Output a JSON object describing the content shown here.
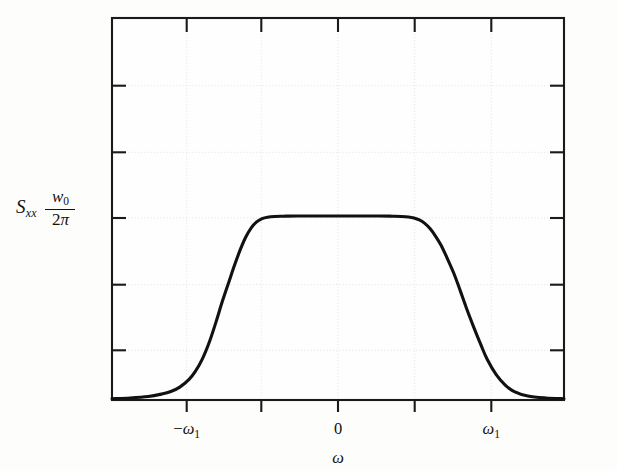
{
  "figure": {
    "background_color": "#fdfdfc",
    "curve_color": "#111111",
    "grid_color": "#e2e2e2",
    "axis_color": "#1a1a1a",
    "y_axis_label_symbol": "S",
    "y_axis_label_subscript": "xx",
    "y_axis_value_numerator": "w",
    "y_axis_value_numerator_sub": "0",
    "y_axis_value_denominator_num": "2",
    "y_axis_value_denominator_sym": "π",
    "x_axis_title": "ω",
    "x_tick_labels": [
      "−ω",
      "0",
      "ω"
    ],
    "x_tick_label_left": "−ω",
    "x_tick_label_left_sub": "1",
    "x_tick_label_center": "0",
    "x_tick_label_right": "ω",
    "x_tick_label_right_sub": "1"
  },
  "chart_data": {
    "type": "line",
    "title": "",
    "subtitle": "",
    "xlabel": "ω",
    "ylabel": "S_xx",
    "legend": [],
    "legend_position": "none",
    "grid": true,
    "grid_style": "dotted",
    "xlim": [
      -2.5,
      2.5
    ],
    "ylim": [
      0,
      1.54
    ],
    "x_tick_values": [
      -1.5,
      -1.0,
      -0.5,
      0.0,
      0.5,
      1.0,
      1.5
    ],
    "x_tick_labels_shown": [
      "-ω₁",
      "0",
      "ω₁"
    ],
    "x_labeled_tick_values": [
      -1.0,
      0.0,
      1.0
    ],
    "y_tick_values": [
      0.0,
      0.257,
      0.514,
      0.771,
      1.028,
      1.285
    ],
    "y_labeled_tick_values": [
      0.771
    ],
    "y_tick_labels_shown": [
      "w₀/2π"
    ],
    "plateau_value": 0.74,
    "annotations": [],
    "series": [
      {
        "name": "S_xx(ω)",
        "description": "Band-limited flat power spectral density with smooth sigmoidal roll-off at ±ω₁",
        "x": [
          -2.5,
          -2.3,
          -2.1,
          -1.95,
          -1.85,
          -1.75,
          -1.65,
          -1.58,
          -1.5,
          -1.42,
          -1.35,
          -1.28,
          -1.2,
          -1.14,
          -1.08,
          -1.02,
          -0.96,
          -0.9,
          -0.84,
          -0.78,
          -0.7,
          -0.6,
          -0.45,
          -0.25,
          0.0,
          0.25,
          0.45,
          0.6,
          0.7,
          0.78,
          0.84,
          0.9,
          0.96,
          1.02,
          1.08,
          1.14,
          1.2,
          1.28,
          1.35,
          1.42,
          1.5,
          1.58,
          1.65,
          1.75,
          1.85,
          1.95,
          2.1,
          2.3,
          2.5
        ],
        "y": [
          0.005,
          0.008,
          0.014,
          0.024,
          0.034,
          0.052,
          0.082,
          0.114,
          0.166,
          0.237,
          0.314,
          0.397,
          0.484,
          0.548,
          0.607,
          0.657,
          0.694,
          0.718,
          0.731,
          0.737,
          0.74,
          0.741,
          0.742,
          0.742,
          0.742,
          0.742,
          0.742,
          0.741,
          0.74,
          0.738,
          0.734,
          0.726,
          0.712,
          0.69,
          0.66,
          0.624,
          0.578,
          0.512,
          0.443,
          0.371,
          0.295,
          0.223,
          0.164,
          0.102,
          0.06,
          0.034,
          0.016,
          0.008,
          0.005
        ]
      }
    ]
  }
}
